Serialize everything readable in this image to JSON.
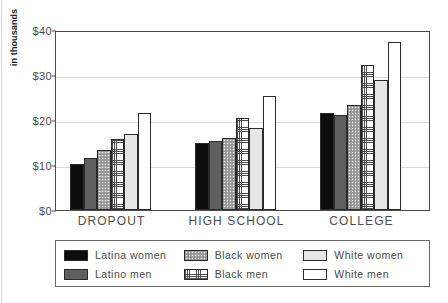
{
  "chart_data": {
    "type": "bar",
    "title": "",
    "xlabel": "",
    "ylabel": "in thousands",
    "ylim": [
      0,
      40
    ],
    "yticks": [
      0,
      10,
      20,
      30,
      40
    ],
    "ytick_labels": [
      "$0",
      "$10",
      "$20",
      "$30",
      "$40"
    ],
    "grid": true,
    "legend_position": "bottom",
    "categories": [
      "DROPOUT",
      "HIGH SCHOOL",
      "COLLEGE"
    ],
    "series": [
      {
        "name": "Latina women",
        "fill": "solid-black",
        "color": "#0d0d0d",
        "values": [
          10.3,
          15.0,
          21.6
        ]
      },
      {
        "name": "Latino men",
        "fill": "solid-dark-gray",
        "color": "#5f5f5f",
        "values": [
          11.6,
          15.4,
          21.1
        ]
      },
      {
        "name": "Black women",
        "fill": "stipple-dots",
        "color": "#a8a8a8",
        "values": [
          13.3,
          16.0,
          23.3
        ]
      },
      {
        "name": "Black men",
        "fill": "fine-crosshatch",
        "color": "#4d4d4d",
        "values": [
          15.7,
          20.4,
          32.2
        ]
      },
      {
        "name": "White women",
        "fill": "light-gray",
        "color": "#e6e6e6",
        "values": [
          17.0,
          18.2,
          29.0
        ]
      },
      {
        "name": "White men",
        "fill": "white",
        "color": "#ffffff",
        "values": [
          21.5,
          25.3,
          37.3
        ]
      }
    ]
  },
  "legend": {
    "columns": [
      [
        "Latina women",
        "Latino men"
      ],
      [
        "Black women",
        "Black men"
      ],
      [
        "White women",
        "White men"
      ]
    ]
  },
  "axis": {
    "y_title": "in thousands"
  }
}
